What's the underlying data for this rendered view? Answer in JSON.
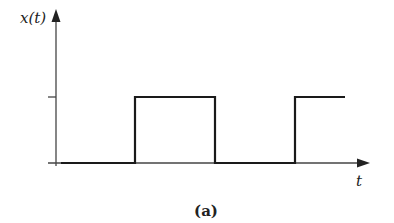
{
  "diagram": {
    "y_axis_label": "x(t)",
    "x_axis_label": "t",
    "caption": "(a)",
    "colors": {
      "line": "#1a1a1a",
      "axis": "#444444",
      "background": "#ffffff"
    },
    "signal_segments": [
      {
        "level": "low",
        "t_start_px": 61,
        "t_end_px": 135
      },
      {
        "level": "high",
        "t_start_px": 135,
        "t_end_px": 215
      },
      {
        "level": "low",
        "t_start_px": 215,
        "t_end_px": 295
      },
      {
        "level": "high",
        "t_start_px": 295,
        "t_end_px": 345
      }
    ]
  }
}
